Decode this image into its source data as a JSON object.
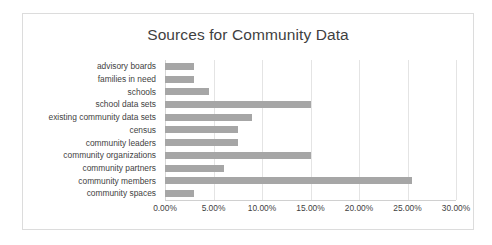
{
  "chart_data": {
    "type": "bar",
    "orientation": "horizontal",
    "title": "Sources for Community Data",
    "xlabel": "",
    "ylabel": "",
    "xlim": [
      0,
      30
    ],
    "xtick_labels": [
      "0.00%",
      "5.00%",
      "10.00%",
      "15.00%",
      "20.00%",
      "25.00%",
      "30.00%"
    ],
    "xtick_values": [
      0,
      5,
      10,
      15,
      20,
      25,
      30
    ],
    "grid": true,
    "legend": false,
    "value_suffix": "%",
    "categories": [
      "advisory boards",
      "families in need",
      "schools",
      "school data sets",
      "existing community data sets",
      "census",
      "community leaders",
      "community organizations",
      "community partners",
      "community members",
      "community spaces"
    ],
    "values": [
      3.0,
      3.0,
      4.5,
      15.0,
      9.0,
      7.5,
      7.5,
      15.0,
      6.1,
      25.5,
      3.0
    ],
    "bar_color": "#a6a6a6",
    "gridline_color": "#e4e4e4",
    "title_color": "#3f3f3f",
    "text_color": "#3f3f3f",
    "border_color": "#dcdcdc",
    "background_color": "#ffffff"
  }
}
